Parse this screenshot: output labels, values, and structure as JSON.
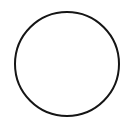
{
  "canvas": {
    "width": 133,
    "height": 128,
    "background_color": "#ffffff",
    "alt_text": "Circle outline"
  },
  "figure": {
    "name": "circle-outline",
    "shape": "circle",
    "center_x": 67,
    "center_y": 64,
    "radius": 52,
    "stroke_color": "#151515",
    "stroke_width": 2,
    "fill": "none",
    "label": "circle"
  }
}
